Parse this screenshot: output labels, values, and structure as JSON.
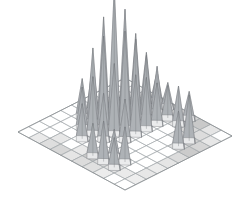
{
  "figure": {
    "title": "",
    "background_color": "#ffffff",
    "outline_color": "#7c8185",
    "grid_color": "#9aa0a4"
  },
  "chart_data": {
    "type": "bar",
    "subtype": "3d-isometric-spike-surface",
    "title": "",
    "xlabel": "",
    "ylabel": "",
    "zlabel": "",
    "grid": true,
    "legend": false,
    "axis_labels_visible": false,
    "tick_labels_visible": false,
    "grid_rows": 10,
    "grid_cols": 10,
    "zlim": [
      0,
      100
    ],
    "projection": {
      "type": "isometric",
      "corner_origin_px": [
        18,
        132
      ],
      "corner_top_px": [
        125,
        78
      ],
      "corner_right_px": [
        233,
        140
      ],
      "corner_bottom_px": [
        125,
        190
      ],
      "height_scale_px_per_unit": 1.35
    },
    "note": "Z matrix values are spike heights in arbitrary units read off the rendered cone apex elevations; 0 means no spike at that cell.",
    "z": [
      [
        0,
        0,
        0,
        0,
        0,
        0,
        0,
        0,
        0,
        0
      ],
      [
        0,
        0,
        0,
        0,
        28,
        36,
        0,
        0,
        0,
        0
      ],
      [
        0,
        0,
        0,
        30,
        55,
        74,
        48,
        30,
        0,
        0
      ],
      [
        0,
        0,
        26,
        42,
        68,
        100,
        80,
        58,
        40,
        22
      ],
      [
        0,
        0,
        0,
        34,
        52,
        72,
        62,
        46,
        34,
        18
      ],
      [
        0,
        24,
        0,
        0,
        30,
        44,
        38,
        30,
        24,
        0
      ],
      [
        0,
        30,
        20,
        0,
        0,
        0,
        0,
        0,
        28,
        20
      ],
      [
        0,
        22,
        26,
        0,
        0,
        0,
        0,
        0,
        0,
        0
      ],
      [
        0,
        0,
        0,
        0,
        0,
        0,
        26,
        34,
        0,
        0
      ],
      [
        0,
        0,
        0,
        0,
        0,
        0,
        0,
        0,
        0,
        0
      ]
    ],
    "base_shading": {
      "description": "Grey fill intensity of base grid cells; 0 = white, 1 = darkest grey",
      "values": [
        [
          0.0,
          0.0,
          0.0,
          0.0,
          0.0,
          0.0,
          0.0,
          0.0,
          0.0,
          0.0
        ],
        [
          0.18,
          0.0,
          0.0,
          0.0,
          0.0,
          0.0,
          0.0,
          0.0,
          0.0,
          0.0
        ],
        [
          0.28,
          0.2,
          0.0,
          0.0,
          0.0,
          0.0,
          0.0,
          0.0,
          0.0,
          0.14
        ],
        [
          0.34,
          0.0,
          0.0,
          0.0,
          0.0,
          0.0,
          0.0,
          0.0,
          0.0,
          0.22
        ],
        [
          0.22,
          0.18,
          0.0,
          0.0,
          0.0,
          0.0,
          0.0,
          0.0,
          0.0,
          0.4
        ],
        [
          0.3,
          0.46,
          0.0,
          0.0,
          0.0,
          0.0,
          0.0,
          0.0,
          0.2,
          0.3
        ],
        [
          0.26,
          0.3,
          0.0,
          0.0,
          0.0,
          0.0,
          0.0,
          0.0,
          0.24,
          0.34
        ],
        [
          0.16,
          0.22,
          0.0,
          0.0,
          0.0,
          0.0,
          0.0,
          0.24,
          0.36,
          0.46
        ],
        [
          0.0,
          0.18,
          0.0,
          0.0,
          0.0,
          0.0,
          0.3,
          0.4,
          0.3,
          0.22
        ],
        [
          0.0,
          0.14,
          0.2,
          0.16,
          0.22,
          0.3,
          0.44,
          0.36,
          0.2,
          0.0
        ]
      ]
    },
    "cone_style": {
      "left_face_color": "#e9eaeb",
      "right_face_color": "#a8adb1",
      "edge_color": "#6e7276",
      "base_half_width_cells": 0.55
    },
    "peaks_summary": [
      {
        "label": "tallest-peak",
        "row": 3,
        "col": 5,
        "height": 100
      },
      {
        "label": "second-peak",
        "row": 3,
        "col": 6,
        "height": 80
      },
      {
        "label": "back-ridge-peak",
        "row": 2,
        "col": 5,
        "height": 74
      },
      {
        "label": "right-ridge-peak",
        "row": 4,
        "col": 5,
        "height": 72
      },
      {
        "label": "front-cluster-peak",
        "row": 8,
        "col": 7,
        "height": 34
      },
      {
        "label": "left-cluster-peak",
        "row": 6,
        "col": 1,
        "height": 30
      }
    ]
  }
}
